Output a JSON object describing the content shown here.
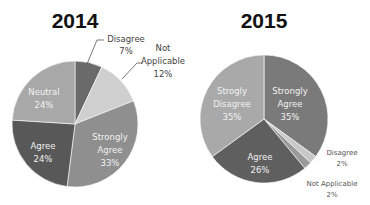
{
  "chart_data": [
    {
      "type": "pie",
      "title": "2014",
      "categories": [
        "Disagree",
        "Not Applicable",
        "Strongly Agree",
        "Agree",
        "Neutral"
      ],
      "values": [
        7,
        12,
        33,
        24,
        24
      ],
      "labels": [
        "Disagree 7%",
        "Not Applicable 12%",
        "Strongly Agree 33%",
        "Agree 24%",
        "Neutral 24%"
      ],
      "colors": [
        "#6a6a6a",
        "#cfcfcf",
        "#8f8f8f",
        "#585858",
        "#a8a8a8"
      ],
      "start_angle_deg": 0,
      "direction": "clockwise"
    },
    {
      "type": "pie",
      "title": "2015",
      "categories": [
        "Strongly Agree",
        "Disagree",
        "Not Applicable",
        "Agree",
        "Strogly Disagree"
      ],
      "values": [
        35,
        2,
        2,
        26,
        35
      ],
      "labels": [
        "Strongly Agree 35%",
        "Disagree 2%",
        "Not Applicable 2%",
        "Agree 26%",
        "Strogly Disagree 35%"
      ],
      "colors": [
        "#7a7a7a",
        "#c8c8c8",
        "#9a9a9a",
        "#5f5f5f",
        "#a9a9a9"
      ],
      "start_angle_deg": 0,
      "direction": "clockwise"
    }
  ],
  "charts": {
    "left": {
      "title": "2014",
      "labels": {
        "disagree": {
          "name": "Disagree",
          "pct": "7%"
        },
        "not_applicable": {
          "name1": "Not",
          "name2": "Applicable",
          "pct": "12%"
        },
        "strongly_agree": {
          "name1": "Strongly",
          "name2": "Agree",
          "pct": "33%"
        },
        "agree": {
          "name": "Agree",
          "pct": "24%"
        },
        "neutral": {
          "name": "Neutral",
          "pct": "24%"
        }
      }
    },
    "right": {
      "title": "2015",
      "labels": {
        "strongly_agree": {
          "name1": "Strongly",
          "name2": "Agree",
          "pct": "35%"
        },
        "disagree": {
          "name": "Disagree",
          "pct": "2%"
        },
        "not_applicable": {
          "name": "Not Applicable",
          "pct": "2%"
        },
        "agree": {
          "name": "Agree",
          "pct": "26%"
        },
        "strogly_disagree": {
          "name1": "Strogly",
          "name2": "Disagree",
          "pct": "35%"
        }
      }
    }
  }
}
